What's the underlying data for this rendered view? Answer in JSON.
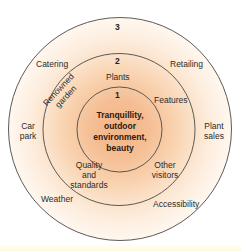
{
  "diagram": {
    "colors": {
      "center_fill": "#f3b486",
      "ring_stroke": "#4a4a4a",
      "background": "#ffffff"
    },
    "rings": [
      {
        "number": "3",
        "labels": {
          "catering": "Catering",
          "retailing": "Retailing",
          "car_park": [
            "Car",
            "park"
          ],
          "plant_sales": [
            "Plant",
            "sales"
          ],
          "weather": "Weather",
          "accessibility": "Accessibility"
        }
      },
      {
        "number": "2",
        "labels": {
          "plants": "Plants",
          "renowned_garden": [
            "Renowned",
            "garden"
          ],
          "features": "Features",
          "quality_and_standards": [
            "Quality",
            "and",
            "standards"
          ],
          "other_visitors": [
            "Other",
            "visitors"
          ]
        }
      },
      {
        "number": "1",
        "core": [
          "Tranquillity,",
          "outdoor",
          "environment,",
          "beauty"
        ]
      }
    ]
  }
}
